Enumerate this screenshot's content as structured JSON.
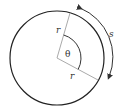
{
  "diagram": {
    "labels": {
      "radius_top": "r",
      "radius_bottom": "r",
      "angle": "θ",
      "arc_length": "s"
    },
    "colors": {
      "circle": "#222222",
      "radius_lines": "#aaaaaa",
      "angle_arc": "#333333",
      "arc_arrow": "#333333",
      "text": "#333333"
    },
    "geometry": {
      "center": [
        57,
        58
      ],
      "circle_radius": 47,
      "radius_top_end": [
        70,
        13
      ],
      "radius_bottom_end": [
        98,
        80
      ],
      "angle_arc_radius": 24
    }
  }
}
